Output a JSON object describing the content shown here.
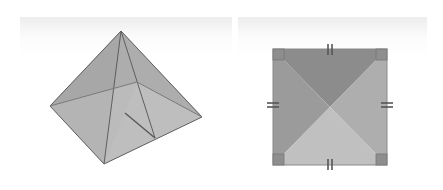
{
  "figure": {
    "left_panel": {
      "label": "square pyramid (3D view)",
      "colors": {
        "left_back_face": "#8a8a8a",
        "right_back_face": "#8e8e8e",
        "front_left_face": "#a8a8a8",
        "front_right_face": "#b4b4b4",
        "edge": "#5a5a5a"
      }
    },
    "right_panel": {
      "label": "square base with diagonals",
      "colors": {
        "top_triangle": "#8c8c8c",
        "left_triangle": "#9a9a9a",
        "right_triangle": "#adadad",
        "bottom_triangle": "#bfbfbf",
        "right_angle_marker": "#8a8a8a",
        "tick": "#555555"
      },
      "equal_side_ticks": 4,
      "right_angle_markers": 4
    }
  }
}
